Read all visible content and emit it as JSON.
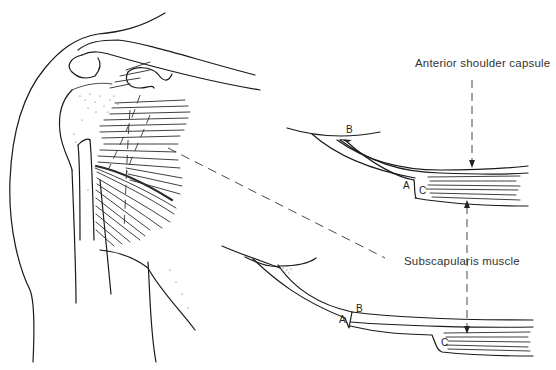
{
  "figure": {
    "type": "anatomical line drawing",
    "labels": {
      "capsule": "Anterior shoulder capsule",
      "muscle": "Subscapularis muscle"
    },
    "upper_section": {
      "letters": {
        "a": "A",
        "b": "B",
        "c": "C"
      }
    },
    "lower_section": {
      "letters": {
        "a": "A",
        "b": "B",
        "c": "C"
      }
    },
    "colors": {
      "ink": "#1a1a1a",
      "label_text": "#333333",
      "background": "#ffffff"
    }
  }
}
